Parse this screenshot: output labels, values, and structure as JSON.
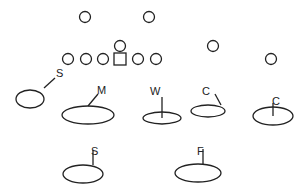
{
  "diagram": {
    "type": "football-defensive-formation",
    "offense": {
      "players": [
        {
          "role": "receiver",
          "shape": "circle",
          "x": 85,
          "y": 17
        },
        {
          "role": "receiver",
          "shape": "circle",
          "x": 149,
          "y": 17
        },
        {
          "role": "lineman",
          "shape": "circle",
          "x": 68,
          "y": 59
        },
        {
          "role": "lineman",
          "shape": "circle",
          "x": 86,
          "y": 59
        },
        {
          "role": "lineman",
          "shape": "circle",
          "x": 103,
          "y": 59
        },
        {
          "role": "center",
          "shape": "square",
          "x": 120,
          "y": 59
        },
        {
          "role": "quarterback",
          "shape": "circle",
          "x": 120,
          "y": 46
        },
        {
          "role": "lineman",
          "shape": "circle",
          "x": 138,
          "y": 59
        },
        {
          "role": "lineman",
          "shape": "circle",
          "x": 156,
          "y": 59
        },
        {
          "role": "back",
          "shape": "circle",
          "x": 213,
          "y": 46
        },
        {
          "role": "receiver",
          "shape": "circle",
          "x": 271,
          "y": 59
        }
      ]
    },
    "defense": {
      "zones": [
        {
          "label": "S",
          "cx": 30,
          "cy": 99,
          "rx": 14,
          "ry": 9,
          "lx1": 44,
          "ly1": 88,
          "lx2": 55,
          "ly2": 78,
          "tx": 56,
          "ty": 77
        },
        {
          "label": "M",
          "cx": 88,
          "cy": 115,
          "rx": 26,
          "ry": 9,
          "lx1": 88,
          "ly1": 106,
          "lx2": 98,
          "ly2": 94,
          "tx": 97,
          "ty": 94
        },
        {
          "label": "W",
          "cx": 162,
          "cy": 118,
          "rx": 19,
          "ry": 6,
          "lx1": 162,
          "ly1": 118,
          "lx2": 162,
          "ly2": 97,
          "tx": 150,
          "ty": 95
        },
        {
          "label": "C",
          "cx": 208,
          "cy": 111,
          "rx": 17,
          "ry": 6,
          "lx1": 221,
          "ly1": 105,
          "lx2": 215,
          "ly2": 94,
          "tx": 202,
          "ty": 95
        },
        {
          "label": "C",
          "cx": 273,
          "cy": 116,
          "rx": 20,
          "ry": 9,
          "lx1": 273,
          "ly1": 116,
          "lx2": 273,
          "ly2": 103,
          "tx": 272,
          "ty": 105
        },
        {
          "label": "S",
          "cx": 83,
          "cy": 174,
          "rx": 20,
          "ry": 9,
          "lx1": 93,
          "ly1": 165,
          "lx2": 93,
          "ly2": 150,
          "tx": 91,
          "ty": 155
        },
        {
          "label": "F",
          "cx": 198,
          "cy": 173,
          "rx": 23,
          "ry": 9,
          "lx1": 203,
          "ly1": 164,
          "lx2": 203,
          "ly2": 149,
          "tx": 197,
          "ty": 155
        }
      ]
    }
  }
}
